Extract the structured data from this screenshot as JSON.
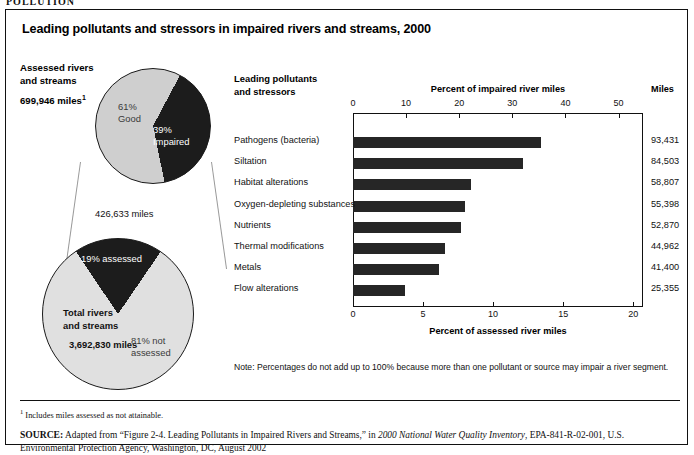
{
  "cutoff_header": "POLLUTION",
  "figure": {
    "title": "Leading pollutants and stressors in impaired rivers and streams, 2000"
  },
  "left_panel": {
    "assessed_label_line1": "Assessed rivers",
    "assessed_label_line2": "and streams",
    "assessed_miles": "699,946 miles",
    "assessed_miles_footnote_marker": "1",
    "pie_top": {
      "slice_good_pct": "61%",
      "slice_good_name": "Good",
      "slice_impaired_pct": "39%",
      "slice_impaired_name": "Impaired"
    },
    "connector_value": "426,633  miles",
    "pie_bottom": {
      "slice_assessed": "19% assessed",
      "total_label_line1": "Total rivers",
      "total_label_line2": "and streams",
      "total_miles": "3,692,830 miles",
      "slice_not_assessed_line1": "81% not",
      "slice_not_assessed_line2": "assessed"
    }
  },
  "chart_panel": {
    "category_header_line1": "Leading pollutants",
    "category_header_line2": "and stressors",
    "miles_header": "Miles",
    "note": "Note: Percentages do not add up to 100% because more than one pollutant or source may impair a river segment."
  },
  "chart_data": {
    "type": "bar",
    "orientation": "horizontal",
    "title": "Leading pollutants and stressors in impaired rivers and streams, 2000",
    "categories": [
      "Pathogens (bacteria)",
      "Siltation",
      "Habitat alterations",
      "Oxygen-depleting substances",
      "Nutrients",
      "Thermal modifications",
      "Metals",
      "Flow alterations"
    ],
    "values_percent_impaired": [
      35.4,
      32.1,
      22.3,
      21.1,
      20.4,
      17.3,
      16.1,
      9.8
    ],
    "values_miles": [
      "93,431",
      "84,503",
      "58,807",
      "55,398",
      "52,870",
      "44,962",
      "41,400",
      "25,355"
    ],
    "top_axis": {
      "label": "Percent of impaired river miles",
      "ticks": [
        0,
        10,
        20,
        30,
        40,
        50
      ],
      "range": [
        0,
        54.6
      ]
    },
    "bottom_axis": {
      "label": "Percent of assessed river miles",
      "ticks": [
        0,
        5,
        10,
        15,
        20
      ],
      "range": [
        0,
        20.7
      ]
    },
    "grid": false,
    "legend": "none",
    "bar_color": "#262626"
  },
  "pie_charts": [
    {
      "name": "assessed-rivers-and-streams",
      "type": "pie",
      "total_label": "699,946 miles",
      "slices": [
        {
          "label": "Good",
          "value": 61
        },
        {
          "label": "Impaired",
          "value": 39
        }
      ]
    },
    {
      "name": "total-rivers-and-streams",
      "type": "pie",
      "total_label": "3,692,830 miles",
      "slices": [
        {
          "label": "assessed",
          "value": 19
        },
        {
          "label": "not assessed",
          "value": 81
        }
      ]
    }
  ],
  "footer": {
    "footnote_marker": "1",
    "footnote_text": " Includes miles assessed as not attainable.",
    "source_label": "SOURCE:",
    "source_text_1": " Adapted from “Figure 2-4. Leading Pollutants in Impaired Rivers and Streams,” in ",
    "source_italic": "2000 National Water Quality Inventory",
    "source_text_2": ", EPA-841-R-02-001, U.S. Environmental Protection Agency, Washington, DC, August 2002"
  }
}
